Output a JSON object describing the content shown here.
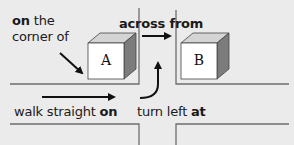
{
  "diagram": {
    "labels": {
      "on_the_corner_of": {
        "bold": "on",
        "rest1": " the",
        "line2": "corner of"
      },
      "across_from": {
        "bold": "across from"
      },
      "walk_straight_on": {
        "plain": "walk straight ",
        "bold": "on"
      },
      "turn_left_at": {
        "plain": "turn left ",
        "bold": "at"
      }
    },
    "cubes": [
      {
        "letter": "A"
      },
      {
        "letter": "B"
      }
    ],
    "colors": {
      "background": "#ebebeb",
      "line": "#6e6e6e",
      "arrow": "#111111",
      "cube_front": "#ffffff",
      "cube_top": "#d4d4d4",
      "cube_side": "#7c7c7c"
    }
  }
}
